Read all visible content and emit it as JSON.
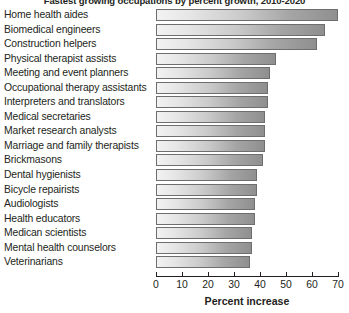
{
  "chart_data": {
    "type": "bar",
    "orientation": "horizontal",
    "title": "Fastest growing occupations by percent growth, 2010-2020",
    "xlabel": "Percent increase",
    "ylabel": "",
    "xlim": [
      0,
      70
    ],
    "xticks": [
      0,
      10,
      20,
      30,
      40,
      50,
      60,
      70
    ],
    "grid": false,
    "legend": null,
    "categories": [
      "Home health aides",
      "Biomedical engineers",
      "Construction helpers",
      "Physical therapist assists",
      "Meeting and event planners",
      "Occupational therapy assistants",
      "Interpreters and translators",
      "Medical secretaries",
      "Market research analysts",
      "Marriage and family therapists",
      "Brickmasons",
      "Dental hygienists",
      "Bicycle repairists",
      "Audiologists",
      "Health educators",
      "Medican scientists",
      "Mental health counselors",
      "Veterinarians"
    ],
    "values": [
      70,
      65,
      62,
      46,
      44,
      43,
      43,
      42,
      42,
      42,
      41,
      39,
      39,
      38,
      38,
      37,
      37,
      36
    ]
  },
  "colors": {
    "bar_gradient_start": "#f2f2f2",
    "bar_gradient_end": "#8f8f8f",
    "bar_border": "#6e6e6e",
    "text": "#231f20",
    "axis": "#231f20",
    "background": "#ffffff"
  }
}
